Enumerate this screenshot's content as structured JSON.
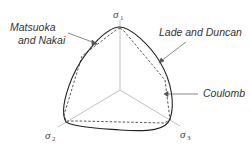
{
  "diagram": {
    "type": "yield-surfaces-deviatoric-plane",
    "axes": [
      {
        "id": "sigma1",
        "symbol": "σ",
        "subscript": "1"
      },
      {
        "id": "sigma2",
        "symbol": "σ",
        "subscript": "2"
      },
      {
        "id": "sigma3",
        "symbol": "σ",
        "subscript": "3"
      }
    ],
    "curves": [
      {
        "id": "matsuoka-nakai",
        "label_line1": "Matsuoka",
        "label_line2": "and Nakai",
        "style": "solid"
      },
      {
        "id": "lade-duncan",
        "label": "Lade and Duncan",
        "style": "solid"
      },
      {
        "id": "coulomb",
        "label": "Coulomb",
        "style": "dashed"
      }
    ],
    "colors": {
      "curve": "#333333",
      "axis": "#aaaaaa",
      "leader": "#555555",
      "text": "#333333"
    }
  }
}
